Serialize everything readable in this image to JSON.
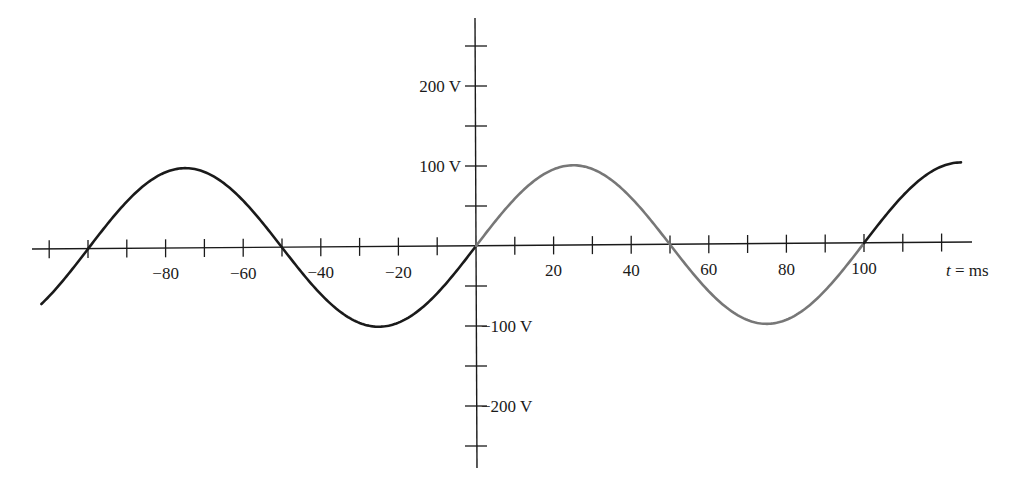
{
  "chart_data": {
    "type": "line",
    "title": "",
    "xlabel": "t = ms",
    "xlabel_italic_part": "t",
    "xlabel_rest": " = ms",
    "ylabel": "",
    "xlim": [
      -115,
      125
    ],
    "ylim": [
      -250,
      250
    ],
    "grid": false,
    "legend": null,
    "x_tick_labels": [
      {
        "value": -80,
        "label": "−80"
      },
      {
        "value": -60,
        "label": "−60"
      },
      {
        "value": -40,
        "label": "−40"
      },
      {
        "value": -20,
        "label": "−20"
      },
      {
        "value": 20,
        "label": "20"
      },
      {
        "value": 40,
        "label": "40"
      },
      {
        "value": 60,
        "label": "60"
      },
      {
        "value": 80,
        "label": "80"
      },
      {
        "value": 100,
        "label": "100"
      }
    ],
    "x_minor_tick_step": 10,
    "y_tick_labels": [
      {
        "value": 200,
        "label": "200 V",
        "side": "left"
      },
      {
        "value": 100,
        "label": "100 V",
        "side": "left"
      },
      {
        "value": -100,
        "label": "−100 V",
        "side": "right"
      },
      {
        "value": -200,
        "label": "−200 V",
        "side": "right"
      }
    ],
    "y_minor_tick_step": 50,
    "series": [
      {
        "name": "v(t) = 100 sin(2π·t/100 ms) V",
        "function": "100*sin(2*pi*t/100)",
        "amplitude": 100,
        "period_ms": 100,
        "color": "#1a1a1a",
        "t_range": [
          -112,
          125
        ],
        "highlight": {
          "t_range": [
            0,
            100
          ],
          "color": "#777777",
          "note": "one period shown in gray"
        },
        "key_points": [
          {
            "t": -100,
            "v": 0
          },
          {
            "t": -75,
            "v": 100
          },
          {
            "t": -50,
            "v": 0
          },
          {
            "t": -25,
            "v": -100
          },
          {
            "t": 0,
            "v": 0
          },
          {
            "t": 25,
            "v": 100
          },
          {
            "t": 50,
            "v": 0
          },
          {
            "t": 75,
            "v": -100
          },
          {
            "t": 100,
            "v": 0
          },
          {
            "t": 125,
            "v": 100
          }
        ]
      }
    ]
  },
  "colors": {
    "axis": "#1a1a1a",
    "curve": "#1a1a1a",
    "highlight_curve": "#777777",
    "background": "#ffffff"
  }
}
